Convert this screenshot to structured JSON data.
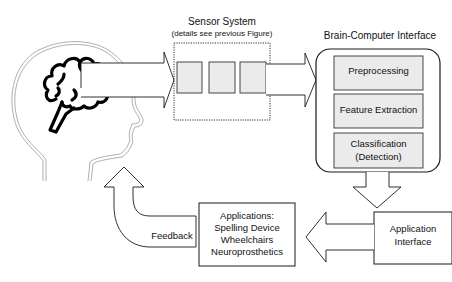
{
  "sensor_system": {
    "title": "Sensor System",
    "subtitle": "(details see previous Figure)",
    "inner_blocks": 3
  },
  "bci": {
    "title": "Brain-Computer Interface",
    "stages": [
      {
        "label": "Preprocessing"
      },
      {
        "label": "Feature Extraction"
      },
      {
        "label": "Classification",
        "label2": "(Detection)"
      }
    ]
  },
  "application_interface": {
    "line1": "Application",
    "line2": "Interface"
  },
  "applications": {
    "lines": [
      "Applications:",
      "Spelling Device",
      "Wheelchairs",
      "Neuroprosthetics"
    ]
  },
  "feedback": {
    "label": "Feedback"
  },
  "colors": {
    "stroke": "#1a1a1a",
    "block_fill": "#ebebeb",
    "head_outline": "#9a9a9a",
    "brain": "#000000"
  }
}
